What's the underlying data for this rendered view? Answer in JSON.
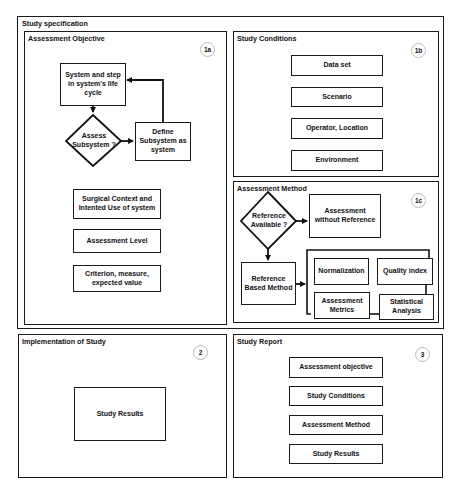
{
  "study_specification": {
    "title": "Study specification",
    "assessment_objective": {
      "title": "Assessment Objective",
      "badge": "1a",
      "flow": {
        "system_step": "System and step in system's life cycle",
        "assess_subsystem": "Assess Subsystem ?",
        "define_subsystem": "Define Subsystem as system"
      },
      "items": [
        "Surgical Context and Intented Use of system",
        "Assessment Level",
        "Criterion, measure, expected value"
      ]
    },
    "study_conditions": {
      "title": "Study Conditions",
      "badge": "1b",
      "items": [
        "Data set",
        "Scenario",
        "Operator, Location",
        "Environment"
      ]
    },
    "assessment_method": {
      "title": "Assessment Method",
      "badge": "1c",
      "reference_available": "Reference Available ?",
      "without_reference": "Assessment without Reference",
      "reference_based": "Reference Based Method",
      "components": {
        "normalization": "Normalization",
        "quality_index": "Quality index",
        "assessment_metrics": "Assessment Metrics",
        "statistical_analysis": "Statistical Analysis"
      }
    }
  },
  "implementation": {
    "title": "Implementation of Study",
    "badge": "2",
    "result": "Study Results"
  },
  "study_report": {
    "title": "Study Report",
    "badge": "3",
    "items": [
      "Assessment objective",
      "Study Conditions",
      "Assessment Method",
      "Study Results"
    ]
  }
}
